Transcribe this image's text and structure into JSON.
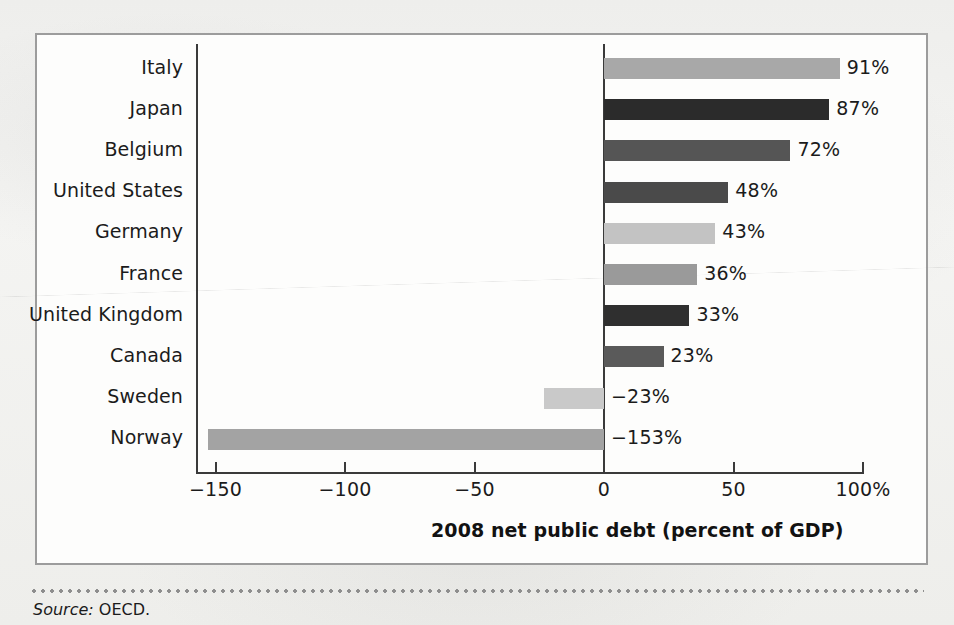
{
  "figure": {
    "source_note_label": "Source:",
    "source_note_text": "OECD."
  },
  "chart_data": {
    "type": "bar",
    "orientation": "horizontal",
    "title": "",
    "xlabel": "2008 net public debt (percent of GDP)",
    "ylabel": "",
    "categories": [
      "Italy",
      "Japan",
      "Belgium",
      "United States",
      "Germany",
      "France",
      "United Kingdom",
      "Canada",
      "Sweden",
      "Norway"
    ],
    "values": [
      91,
      87,
      72,
      48,
      43,
      36,
      33,
      23,
      -23,
      -153
    ],
    "value_labels": [
      "91%",
      "87%",
      "72%",
      "48%",
      "43%",
      "36%",
      "33%",
      "23%",
      "-23%",
      "-153%"
    ],
    "bar_colors": [
      "#a8a8a8",
      "#2b2b2b",
      "#555555",
      "#4a4a4a",
      "#c3c3c3",
      "#9a9a9a",
      "#2f2f2f",
      "#5a5a5a",
      "#c9c9c9",
      "#a3a3a3"
    ],
    "xlim": [
      -153,
      100
    ],
    "xticks": [
      -150,
      -100,
      -50,
      0,
      50,
      100
    ],
    "xtick_labels": [
      "-150",
      "-100",
      "-50",
      "0",
      "50",
      "100%"
    ],
    "grid": false,
    "legend": "none",
    "zero_line": 0
  }
}
